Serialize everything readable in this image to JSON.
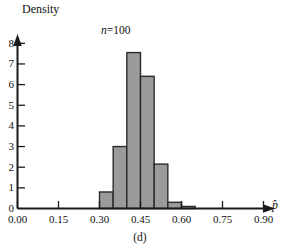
{
  "figure": {
    "caption": "(d)",
    "annotation_n": "n",
    "annotation_eq": "=",
    "annotation_value": "100"
  },
  "chart_data": {
    "type": "bar",
    "title": "",
    "subtitle": "n = 100",
    "xlabel": "p̂",
    "ylabel": "Density",
    "xlim": [
      0.0,
      0.975
    ],
    "ylim": [
      0,
      8.4
    ],
    "grid": false,
    "legend": null,
    "bin_width": 0.05,
    "bin_edges": [
      0.3,
      0.35,
      0.4,
      0.45,
      0.5,
      0.55,
      0.6,
      0.65
    ],
    "categories": [
      "0.30-0.35",
      "0.35-0.40",
      "0.40-0.45",
      "0.45-0.50",
      "0.50-0.55",
      "0.55-0.60",
      "0.60-0.65"
    ],
    "values": [
      0.8,
      3.0,
      7.55,
      6.4,
      2.15,
      0.3,
      0.1
    ],
    "bar_fill": "#9b9b9b",
    "bar_stroke": "#2b2b2b",
    "xticks": [
      0.0,
      0.15,
      0.3,
      0.45,
      0.6,
      0.75,
      0.9
    ],
    "xtick_labels": [
      "0.00",
      "0.15",
      "0.30",
      "0.45",
      "0.60",
      "0.75",
      "0.90"
    ],
    "yticks": [
      0,
      1,
      2,
      3,
      4,
      5,
      6,
      7,
      8
    ],
    "ytick_labels": [
      "0",
      "1",
      "2",
      "3",
      "4",
      "5",
      "6",
      "7",
      "8"
    ]
  }
}
